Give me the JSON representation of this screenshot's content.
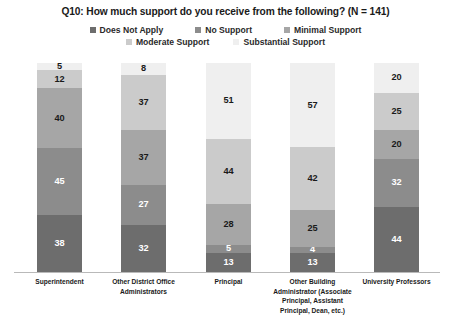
{
  "chart_data": {
    "type": "bar",
    "stacked": true,
    "stack_mode": "percent",
    "title": "Q10: How much support do you receive from the following? (N = 141)",
    "xlabel": "",
    "ylabel": "",
    "grid": false,
    "legend_position": "top",
    "axis_visible": {
      "x_baseline": true,
      "y_axis": false,
      "y_ticks": false
    },
    "sample_size": "N = 141",
    "categories": [
      "Superintendent",
      "Other District Office Administrators",
      "Principal",
      "Other Building Administrator (Associate Principal, Assistant Principal, Dean, etc.)",
      "University Professors"
    ],
    "series": [
      {
        "name": "Does Not Apply",
        "color": "#6d6d6d",
        "values": [
          38,
          32,
          13,
          13,
          44
        ]
      },
      {
        "name": "No Support",
        "color": "#8c8c8c",
        "values": [
          45,
          27,
          5,
          4,
          32
        ]
      },
      {
        "name": "Minimal Support",
        "color": "#a6a6a6",
        "values": [
          40,
          37,
          28,
          25,
          20
        ]
      },
      {
        "name": "Moderate Support",
        "color": "#cbcbcb",
        "values": [
          12,
          37,
          44,
          42,
          25
        ]
      },
      {
        "name": "Substantial Support",
        "color": "#efefef",
        "values": [
          5,
          8,
          51,
          57,
          20
        ]
      }
    ],
    "stack_order_top_to_bottom": [
      "Substantial Support",
      "Moderate Support",
      "Minimal Support",
      "No Support",
      "Does Not Apply"
    ],
    "ylim": [
      0,
      100
    ]
  },
  "legend": {
    "row1": [
      {
        "label": "Does Not Apply",
        "color": "#6d6d6d"
      },
      {
        "label": "No Support",
        "color": "#8c8c8c"
      },
      {
        "label": "Minimal Support",
        "color": "#a6a6a6"
      }
    ],
    "row2": [
      {
        "label": "Moderate Support",
        "color": "#cbcbcb"
      },
      {
        "label": "Substantial Support",
        "color": "#efefef"
      }
    ]
  },
  "bars": [
    {
      "category": "Superintendent",
      "category_lines": [
        "Superintendent"
      ],
      "segments": [
        {
          "series": "Substantial Support",
          "value": 5,
          "label": "5",
          "color": "#efefef",
          "text_color": "#1a1a1a"
        },
        {
          "series": "Moderate Support",
          "value": 12,
          "label": "12",
          "color": "#cbcbcb",
          "text_color": "#1a1a1a"
        },
        {
          "series": "Minimal Support",
          "value": 40,
          "label": "40",
          "color": "#a6a6a6",
          "text_color": "#1a1a1a"
        },
        {
          "series": "No Support",
          "value": 45,
          "label": "45",
          "color": "#8c8c8c",
          "text_color": "#ffffff"
        },
        {
          "series": "Does Not Apply",
          "value": 38,
          "label": "38",
          "color": "#6d6d6d",
          "text_color": "#ffffff"
        }
      ]
    },
    {
      "category": "Other District Office Administrators",
      "category_lines": [
        "Other District Office",
        "Administrators"
      ],
      "segments": [
        {
          "series": "Substantial Support",
          "value": 8,
          "label": "8",
          "color": "#efefef",
          "text_color": "#1a1a1a"
        },
        {
          "series": "Moderate Support",
          "value": 37,
          "label": "37",
          "color": "#cbcbcb",
          "text_color": "#1a1a1a"
        },
        {
          "series": "Minimal Support",
          "value": 37,
          "label": "37",
          "color": "#a6a6a6",
          "text_color": "#1a1a1a"
        },
        {
          "series": "No Support",
          "value": 27,
          "label": "27",
          "color": "#8c8c8c",
          "text_color": "#ffffff"
        },
        {
          "series": "Does Not Apply",
          "value": 32,
          "label": "32",
          "color": "#6d6d6d",
          "text_color": "#ffffff"
        }
      ]
    },
    {
      "category": "Principal",
      "category_lines": [
        "Principal"
      ],
      "segments": [
        {
          "series": "Substantial Support",
          "value": 51,
          "label": "51",
          "color": "#efefef",
          "text_color": "#1a1a1a"
        },
        {
          "series": "Moderate Support",
          "value": 44,
          "label": "44",
          "color": "#cbcbcb",
          "text_color": "#1a1a1a"
        },
        {
          "series": "Minimal Support",
          "value": 28,
          "label": "28",
          "color": "#a6a6a6",
          "text_color": "#1a1a1a"
        },
        {
          "series": "No Support",
          "value": 5,
          "label": "5",
          "color": "#8c8c8c",
          "text_color": "#ffffff"
        },
        {
          "series": "Does Not Apply",
          "value": 13,
          "label": "13",
          "color": "#6d6d6d",
          "text_color": "#ffffff"
        }
      ]
    },
    {
      "category": "Other Building Administrator (Associate Principal, Assistant Principal, Dean, etc.)",
      "category_lines": [
        "Other Building",
        "Administrator (Associate",
        "Principal, Assistant",
        "Principal, Dean, etc.)"
      ],
      "segments": [
        {
          "series": "Substantial Support",
          "value": 57,
          "label": "57",
          "color": "#efefef",
          "text_color": "#1a1a1a"
        },
        {
          "series": "Moderate Support",
          "value": 42,
          "label": "42",
          "color": "#cbcbcb",
          "text_color": "#1a1a1a"
        },
        {
          "series": "Minimal Support",
          "value": 25,
          "label": "25",
          "color": "#a6a6a6",
          "text_color": "#1a1a1a"
        },
        {
          "series": "No Support",
          "value": 4,
          "label": "4",
          "color": "#8c8c8c",
          "text_color": "#ffffff"
        },
        {
          "series": "Does Not Apply",
          "value": 13,
          "label": "13",
          "color": "#6d6d6d",
          "text_color": "#ffffff"
        }
      ]
    },
    {
      "category": "University Professors",
      "category_lines": [
        "University Professors"
      ],
      "segments": [
        {
          "series": "Substantial Support",
          "value": 20,
          "label": "20",
          "color": "#efefef",
          "text_color": "#1a1a1a"
        },
        {
          "series": "Moderate Support",
          "value": 25,
          "label": "25",
          "color": "#cbcbcb",
          "text_color": "#1a1a1a"
        },
        {
          "series": "Minimal Support",
          "value": 20,
          "label": "20",
          "color": "#a6a6a6",
          "text_color": "#1a1a1a"
        },
        {
          "series": "No Support",
          "value": 32,
          "label": "32",
          "color": "#8c8c8c",
          "text_color": "#ffffff"
        },
        {
          "series": "Does Not Apply",
          "value": 44,
          "label": "44",
          "color": "#6d6d6d",
          "text_color": "#ffffff"
        }
      ]
    }
  ],
  "layout": {
    "bar_left_positions": [
      37,
      121,
      206,
      290,
      374
    ],
    "bar_width": 45,
    "label_left_positions": [
      7,
      91,
      176,
      260,
      344
    ],
    "label_width": 105
  }
}
